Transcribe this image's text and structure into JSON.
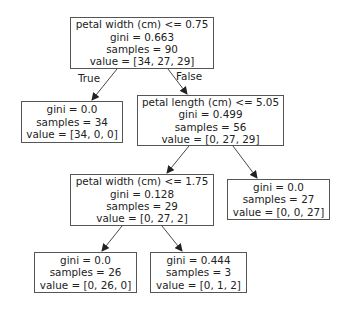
{
  "tree": {
    "nodes": [
      {
        "id": "root",
        "lines": [
          "petal width (cm) <= 0.75",
          "gini = 0.663",
          "samples = 90",
          "value = [34, 27, 29]"
        ]
      },
      {
        "id": "leaf-left",
        "lines": [
          "gini = 0.0",
          "samples = 34",
          "value = [34, 0, 0]"
        ]
      },
      {
        "id": "split-length",
        "lines": [
          "petal length (cm) <= 5.05",
          "gini = 0.499",
          "samples = 56",
          "value = [0, 27, 29]"
        ]
      },
      {
        "id": "split-width2",
        "lines": [
          "petal width (cm) <= 1.75",
          "gini = 0.128",
          "samples = 29",
          "value = [0, 27, 2]"
        ]
      },
      {
        "id": "leaf-27",
        "lines": [
          "gini = 0.0",
          "samples = 27",
          "value = [0, 0, 27]"
        ]
      },
      {
        "id": "leaf-26",
        "lines": [
          "gini = 0.0",
          "samples = 26",
          "value = [0, 26, 0]"
        ]
      },
      {
        "id": "leaf-3",
        "lines": [
          "gini = 0.444",
          "samples = 3",
          "value = [0, 1, 2]"
        ]
      }
    ],
    "edge_labels": {
      "true_label": "True",
      "false_label": "False"
    }
  }
}
